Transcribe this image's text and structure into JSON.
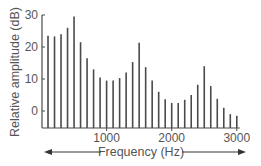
{
  "chart_data": {
    "type": "bar",
    "title": "",
    "xlabel": "Frequency (Hz)",
    "ylabel": "Relative amplitude (dB)",
    "xlim": [
      0,
      3000
    ],
    "ylim": [
      -5,
      30
    ],
    "x_ticks": [
      1000,
      2000,
      3000
    ],
    "y_ticks": [
      0,
      10,
      20,
      30
    ],
    "grid": false,
    "legend": null,
    "style": "line spectrum (vertical lines at harmonics)",
    "x": [
      100,
      200,
      300,
      400,
      500,
      600,
      700,
      800,
      900,
      1000,
      1100,
      1200,
      1300,
      1400,
      1500,
      1600,
      1700,
      1800,
      1900,
      2000,
      2100,
      2200,
      2300,
      2400,
      2500,
      2600,
      2700,
      2800,
      2900,
      3000
    ],
    "values": [
      23.5,
      23.3,
      24,
      26,
      29.5,
      21.5,
      16.5,
      13,
      10.5,
      9.5,
      9.5,
      10.3,
      12,
      15.3,
      21.3,
      13.7,
      9.5,
      6,
      3.7,
      2.5,
      2.5,
      3.5,
      5,
      8.2,
      14,
      7.8,
      3.8,
      1,
      -1,
      -1.5
    ],
    "annotations": [
      "double-headed arrow spanning the frequency axis"
    ]
  },
  "labels": {
    "y_axis_title": "Relative amplitude (dB)",
    "x_axis_title": "Frequency (Hz)",
    "y_ticks": [
      "0",
      "10",
      "20",
      "30"
    ],
    "x_ticks": [
      "1000",
      "2000",
      "3000"
    ]
  },
  "colors": {
    "line": "#4a4a4a",
    "text": "#555555",
    "background": "#ffffff"
  }
}
